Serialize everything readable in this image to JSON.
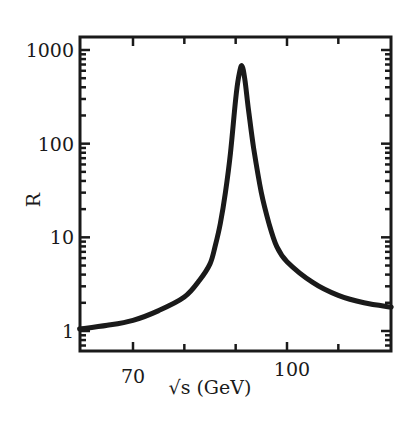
{
  "chart_data": {
    "type": "line",
    "title": "",
    "xlabel": "√s (GeV)",
    "ylabel": "R",
    "xscale": "linear",
    "yscale": "log",
    "xlim": [
      59.6,
      120.3
    ],
    "ylim": [
      0.78,
      1400
    ],
    "x_ticks": [
      70,
      80,
      90,
      100,
      110
    ],
    "x_tick_labels": [
      {
        "value": 70,
        "label": "70"
      },
      {
        "value": 100,
        "label": "100"
      }
    ],
    "y_ticks": [
      1,
      10,
      100,
      1000
    ],
    "y_tick_labels": [
      {
        "value": 1,
        "label": "1"
      },
      {
        "value": 10,
        "label": "10"
      },
      {
        "value": 100,
        "label": "100"
      },
      {
        "value": 1000,
        "label": "1000"
      }
    ],
    "grid": false,
    "legend": null,
    "series": [
      {
        "name": "R",
        "color": "#1a1a1a",
        "x": [
          59.6,
          65,
          70,
          75,
          80,
          83,
          85,
          86,
          87,
          88,
          89,
          90,
          90.6,
          91.2,
          91.8,
          92.5,
          93.5,
          95,
          96.5,
          98,
          100,
          105,
          110,
          115,
          120.3
        ],
        "y": [
          1.05,
          1.15,
          1.3,
          1.65,
          2.3,
          3.5,
          5.2,
          8,
          14,
          30,
          80,
          300,
          520,
          680,
          480,
          230,
          90,
          30,
          14,
          8,
          5.5,
          3.3,
          2.4,
          2.0,
          1.8
        ]
      }
    ],
    "annotations": [
      {
        "text": "Z peak",
        "x": 91.2,
        "y": 680,
        "visible": false
      }
    ]
  },
  "figure": {
    "frame_color": "#1a1a1a",
    "background": "#ffffff"
  }
}
